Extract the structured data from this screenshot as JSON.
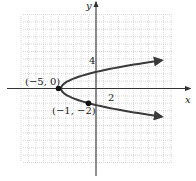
{
  "chart_data": {
    "type": "line",
    "title": "",
    "xlabel": "x",
    "ylabel": "y",
    "xlim": [
      -10,
      10
    ],
    "ylim": [
      -10,
      10
    ],
    "grid": true,
    "grid_step": 2,
    "tick_labels": {
      "x": [
        "2"
      ],
      "y": [
        "4"
      ]
    },
    "series": [
      {
        "name": "x = y^2 - 5",
        "equation": "x = y^2 - 5",
        "y_range": [
          -3.8,
          3.8
        ],
        "arrows": "both-ends"
      }
    ],
    "points": [
      {
        "x": -5,
        "y": 0,
        "label": "(−5, 0)"
      },
      {
        "x": -1,
        "y": -2,
        "label": "(−1, −2)"
      }
    ],
    "colors": {
      "curve": "#3a3a3a",
      "grid": "#c8c8c8",
      "axis": "#333333"
    }
  }
}
